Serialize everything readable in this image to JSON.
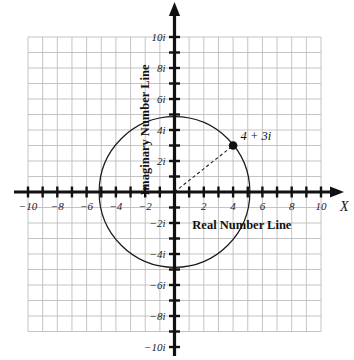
{
  "chart_data": {
    "type": "scatter",
    "title": "",
    "xlabel": "Real Number Line",
    "ylabel": "Imaginary Number Line",
    "axis_letter": "X",
    "xlim": [
      -10,
      10
    ],
    "ylim": [
      -10,
      10
    ],
    "grid": true,
    "grid_step": 1,
    "legend": "none",
    "x_tick_labels": [
      "-10",
      "-8",
      "-6",
      "-4",
      "-2",
      "2",
      "4",
      "6",
      "8",
      "10"
    ],
    "x_tick_values": [
      -10,
      -8,
      -6,
      -4,
      -2,
      2,
      4,
      6,
      8,
      10
    ],
    "y_tick_labels": [
      "10i",
      "8i",
      "6i",
      "4i",
      "2i",
      "-2i",
      "-4i",
      "-6i",
      "-8i",
      "-10i"
    ],
    "y_tick_values": [
      10,
      8,
      6,
      4,
      2,
      -2,
      -4,
      -6,
      -8,
      -10
    ],
    "points": [
      {
        "label": "4 + 3i",
        "real": 4,
        "imaginary": 3,
        "marker": "filled-circle"
      }
    ],
    "circle": {
      "center_real": 0,
      "center_imaginary": 0,
      "radius": 5,
      "style": "solid"
    },
    "radius_segment": {
      "from": [
        0,
        0
      ],
      "to": [
        4,
        3
      ],
      "style": "dashed"
    },
    "colors": {
      "axis": "#111111",
      "grid": "#b9b9b9",
      "curve": "#1a1a1a",
      "point": "#111111",
      "background": "#ffffff"
    }
  }
}
